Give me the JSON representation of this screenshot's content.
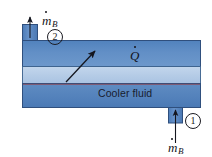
{
  "figure": {
    "background_color": "#ffffff"
  },
  "duct": {
    "label_cooler_fluid": "Cooler fluid",
    "color_top_band": "#5b87bf",
    "color_middle_band": "#b9cfe8",
    "color_bottom_band": "#5d89c0",
    "color_outline": "#2f4f7d",
    "color_thin_line": "#8a4a57"
  },
  "heat": {
    "symbol": "Q",
    "has_dot": true,
    "arrow_direction": "up-right",
    "arrow_color": "#14161f"
  },
  "ports": {
    "outlet": {
      "state_number": "2",
      "mass_flow_symbol": "m",
      "mass_flow_subscript": "B",
      "has_dot": true,
      "arrow_direction": "up",
      "arrow_color": "#14161f"
    },
    "inlet": {
      "state_number": "1",
      "mass_flow_symbol": "m",
      "mass_flow_subscript": "B",
      "has_dot": true,
      "arrow_direction": "up",
      "arrow_color": "#14161f"
    }
  }
}
